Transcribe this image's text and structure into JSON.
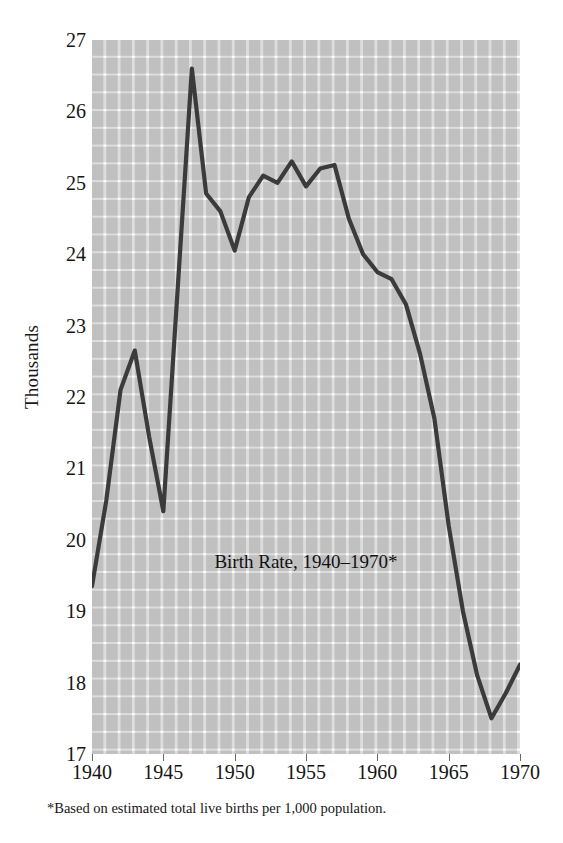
{
  "chart_data": {
    "type": "line",
    "title": "Birth Rate, 1940–1970*",
    "xlabel": "",
    "ylabel": "Thousands",
    "footnote": "*Based on estimated total live births per 1,000 population.",
    "xlim": [
      1940,
      1970
    ],
    "ylim": [
      17,
      27
    ],
    "grid": true,
    "legend": null,
    "x_tick_labels": [
      "1940",
      "1945",
      "1950",
      "1955",
      "1960",
      "1965",
      "1970"
    ],
    "x_ticks": [
      1940,
      1945,
      1950,
      1955,
      1960,
      1965,
      1970
    ],
    "y_tick_labels": [
      "27",
      "26",
      "25",
      "24",
      "23",
      "22",
      "21",
      "20",
      "19",
      "18",
      "17"
    ],
    "y_ticks": [
      27,
      26,
      25,
      24,
      23,
      22,
      21,
      20,
      19,
      18,
      17
    ],
    "line_color": "#3b3b3b",
    "grid_color": "#dddddd",
    "background_color": "#ffffff",
    "x": [
      1940,
      1941,
      1942,
      1943,
      1944,
      1945,
      1946,
      1947,
      1948,
      1949,
      1950,
      1951,
      1952,
      1953,
      1954,
      1955,
      1956,
      1957,
      1958,
      1959,
      1960,
      1961,
      1962,
      1963,
      1964,
      1965,
      1966,
      1967,
      1968,
      1969,
      1970
    ],
    "values": [
      19.35,
      20.55,
      22.1,
      22.65,
      21.45,
      20.4,
      23.5,
      26.6,
      24.85,
      24.6,
      24.05,
      24.8,
      25.1,
      25.0,
      25.3,
      24.95,
      25.2,
      25.25,
      24.5,
      24.0,
      23.75,
      23.65,
      23.3,
      22.6,
      21.7,
      20.2,
      19.0,
      18.1,
      17.5,
      17.85,
      18.25
    ],
    "annotations": [
      {
        "text": "Birth Rate, 1940–1970*",
        "x": 1955,
        "y": 19.45
      }
    ]
  },
  "axis": {
    "y_label_text": "Thousands"
  }
}
